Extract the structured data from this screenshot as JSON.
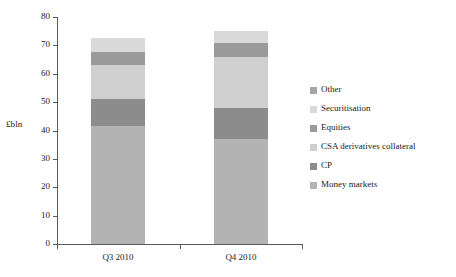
{
  "chart_data": {
    "type": "bar",
    "subtype": "stacked-vertical",
    "title": "",
    "xlabel": "",
    "ylabel": "£bln",
    "categories": [
      "Q3 2010",
      "Q4 2010"
    ],
    "ylim": [
      0,
      80
    ],
    "ytick_step": 10,
    "ytick_labels": [
      "80",
      "70",
      "60",
      "50",
      "40",
      "30",
      "20",
      "10",
      "0"
    ],
    "ytick_values": [
      80,
      70,
      60,
      50,
      40,
      30,
      20,
      10,
      0
    ],
    "grid": false,
    "legend_position": "right",
    "series": [
      {
        "name": "Money markets",
        "color": "#b3b3b3",
        "values": [
          41.5,
          37.0
        ]
      },
      {
        "name": "CP",
        "color": "#8c8c8c",
        "values": [
          9.5,
          11.0
        ]
      },
      {
        "name": "CSA derivatives collateral",
        "color": "#cfcfcf",
        "values": [
          12.0,
          18.0
        ]
      },
      {
        "name": "Equities",
        "color": "#9a9a9a",
        "values": [
          4.5,
          5.0
        ]
      },
      {
        "name": "Securitisation",
        "color": "#d9d9d9",
        "values": [
          5.0,
          4.0
        ]
      },
      {
        "name": "Other",
        "color": "#a6a6a6",
        "values": [
          0.0,
          0.0
        ]
      }
    ],
    "totals": [
      72.5,
      75.0
    ],
    "legend_entries": [
      {
        "label": "Other",
        "color": "#a6a6a6"
      },
      {
        "label": "Securitisation",
        "color": "#d9d9d9"
      },
      {
        "label": "Equities",
        "color": "#9a9a9a"
      },
      {
        "label": "CSA derivatives collateral",
        "color": "#cfcfcf"
      },
      {
        "label": "CP",
        "color": "#8c8c8c"
      },
      {
        "label": "Money markets",
        "color": "#b3b3b3"
      }
    ]
  },
  "axis": {
    "y_title": "£bln"
  }
}
